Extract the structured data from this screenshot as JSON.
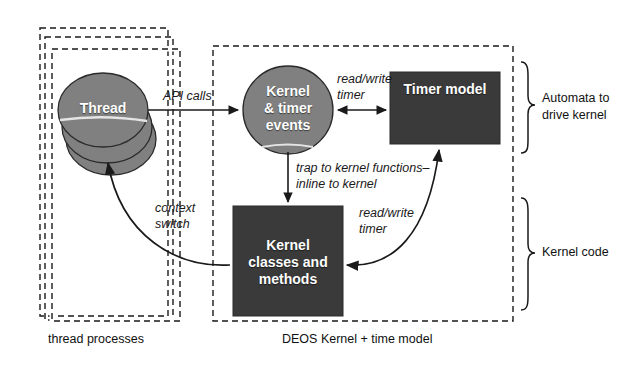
{
  "diagram": {
    "background_color": "#ffffff",
    "line_color": "#1a1a1a",
    "node_fill_gray": "#808080",
    "node_fill_dark": "#3a3a3a",
    "node_text_color": "#ffffff"
  },
  "groups": [
    {
      "id": "thread-processes",
      "label": "thread processes",
      "style": "dashed",
      "stacked_copies": 3
    },
    {
      "id": "deos-kernel",
      "label": "DEOS Kernel + time model",
      "style": "dashed",
      "stacked_copies": 1
    }
  ],
  "nodes": [
    {
      "id": "thread",
      "label": "Thread",
      "shape": "stacked-ellipse",
      "fill": "#808080",
      "copies": 3
    },
    {
      "id": "kernel-timer-events",
      "label_lines": [
        "Kernel",
        "& timer",
        "events"
      ],
      "shape": "ellipse",
      "fill": "#808080"
    },
    {
      "id": "timer-model",
      "label": "Timer model",
      "shape": "rect",
      "fill": "#3a3a3a"
    },
    {
      "id": "kernel-classes-methods",
      "label_lines": [
        "Kernel",
        "classes and",
        "methods"
      ],
      "shape": "rect",
      "fill": "#3a3a3a"
    }
  ],
  "edges": [
    {
      "id": "api-calls",
      "from": "thread",
      "to": "kernel-timer-events",
      "label": "API calls",
      "arrow": "single"
    },
    {
      "id": "read-write-timer-top",
      "from": "kernel-timer-events",
      "to": "timer-model",
      "label_lines": [
        "read/write",
        "timer"
      ],
      "arrow": "double"
    },
    {
      "id": "trap-to-kernel",
      "from": "kernel-timer-events",
      "to": "kernel-classes-methods",
      "label_lines": [
        "trap to kernel functions–",
        "inline to kernel"
      ],
      "arrow": "single"
    },
    {
      "id": "read-write-timer-bottom",
      "from": "timer-model",
      "to": "kernel-classes-methods",
      "label_lines": [
        "read/write",
        "timer"
      ],
      "arrow": "double-curved"
    },
    {
      "id": "context-switch",
      "from": "kernel-classes-methods",
      "to": "thread",
      "label_lines": [
        "context",
        "switch"
      ],
      "arrow": "single-curved"
    }
  ],
  "braces": [
    {
      "id": "automata-brace",
      "label_lines": [
        "Automata to",
        "drive kernel"
      ]
    },
    {
      "id": "kernel-code-brace",
      "label_lines": [
        "Kernel code"
      ]
    }
  ]
}
